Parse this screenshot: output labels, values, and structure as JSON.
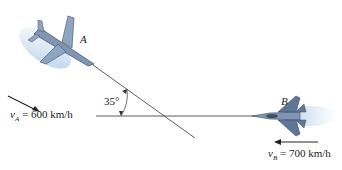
{
  "figure": {
    "plane_a": {
      "label": "A",
      "velocity_symbol": "v",
      "velocity_subscript": "A",
      "velocity_value": "= 600 km/h"
    },
    "plane_b": {
      "label": "B",
      "velocity_symbol": "v",
      "velocity_subscript": "B",
      "velocity_value": "= 700 km/h"
    },
    "angle_label": "35°",
    "colors": {
      "plane_body": "#7f97b5",
      "plane_dark": "#3e4f66",
      "motion_blur": "#a9c6e8",
      "line": "#333333"
    }
  }
}
